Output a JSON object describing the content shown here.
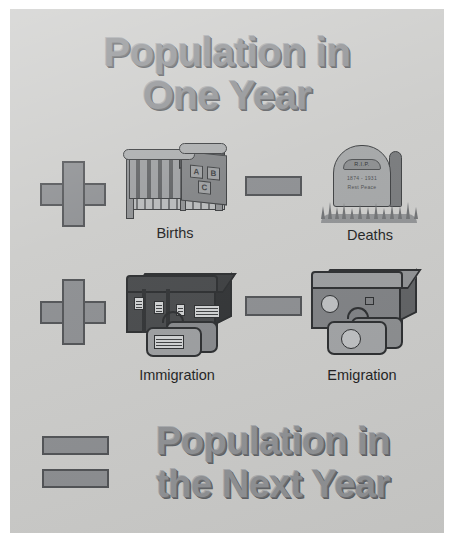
{
  "poster": {
    "background_color": "#cbcbc9",
    "title_color": "#8f9194",
    "glyph_color": "#8b8d90",
    "glyph_outline_color": "#4f5154",
    "title_top": {
      "line1": "Population in",
      "line2": "One Year"
    },
    "title_bottom": {
      "line1": "Population in",
      "line2": "the Next Year"
    },
    "equation": {
      "rows": [
        {
          "left": {
            "operator": "+",
            "operator_name": "plus-sign",
            "label": "Births",
            "icon": "crib-icon"
          },
          "right": {
            "operator": "−",
            "operator_name": "minus-sign",
            "label": "Deaths",
            "icon": "tombstone-icon"
          }
        },
        {
          "left": {
            "operator": "+",
            "operator_name": "plus-sign",
            "label": "Immigration",
            "icon": "luggage-icon"
          },
          "right": {
            "operator": "−",
            "operator_name": "minus-sign",
            "label": "Emigration",
            "icon": "suitcase-icon"
          }
        }
      ],
      "result_operator": "=",
      "result_operator_name": "equals-sign"
    },
    "crib_blocks": [
      "A",
      "B",
      "C"
    ],
    "tombstone": {
      "band_text": "R.I.P.",
      "epitaph_line1": "1874  -  1931",
      "epitaph_line2": "Rest   Peace"
    }
  }
}
